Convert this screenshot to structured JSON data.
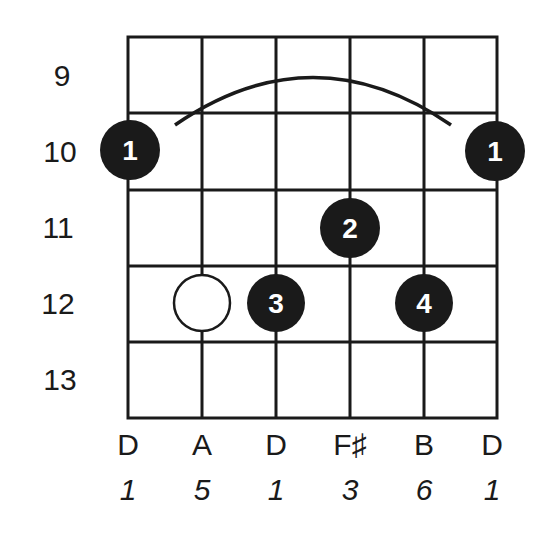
{
  "diagram": {
    "type": "guitar-chord-diagram",
    "fret_numbers": [
      "9",
      "10",
      "11",
      "12",
      "13"
    ],
    "strings": [
      {
        "note": "D",
        "interval": "1"
      },
      {
        "note": "A",
        "interval": "5"
      },
      {
        "note": "D",
        "interval": "1"
      },
      {
        "note": "F♯",
        "interval": "3"
      },
      {
        "note": "B",
        "interval": "6"
      },
      {
        "note": "D",
        "interval": "1"
      }
    ],
    "barre": {
      "fret": "10",
      "from_string": 1,
      "to_string": 6,
      "finger": "1"
    },
    "dots": [
      {
        "string": 1,
        "fret": "10",
        "finger": "1",
        "style": "filled"
      },
      {
        "string": 6,
        "fret": "10",
        "finger": "1",
        "style": "filled"
      },
      {
        "string": 4,
        "fret": "11",
        "finger": "2",
        "style": "filled"
      },
      {
        "string": 3,
        "fret": "12",
        "finger": "3",
        "style": "filled"
      },
      {
        "string": 5,
        "fret": "12",
        "finger": "4",
        "style": "filled"
      },
      {
        "string": 2,
        "fret": "12",
        "finger": "",
        "style": "open"
      }
    ],
    "colors": {
      "ink": "#1a1a1a",
      "background": "#ffffff",
      "dot_text": "#ffffff"
    }
  }
}
